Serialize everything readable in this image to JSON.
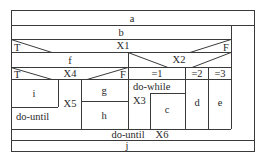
{
  "diagram": {
    "type": "nassi-shneiderman",
    "stroke_color": "#3a3a3a",
    "text_color": "#2a2a2a",
    "blocks": {
      "a": "a",
      "b": "b",
      "f": "f",
      "i": "i",
      "g": "g",
      "h": "h",
      "c": "c",
      "d": "d",
      "e": "e",
      "j": "j"
    },
    "conditions": {
      "x1": {
        "label": "X1",
        "true": "T",
        "false": "F"
      },
      "x2": {
        "label": "X2",
        "cases": [
          "=1",
          "=2",
          "=3"
        ]
      },
      "x4": {
        "label": "X4",
        "true": "T",
        "false": "F"
      }
    },
    "loops": {
      "inner_do_until": {
        "keyword": "do-until",
        "condition": "X5"
      },
      "do_while": {
        "keyword": "do-while",
        "condition": "X3"
      },
      "outer_do_until": {
        "keyword": "do-until",
        "condition": "X6"
      }
    }
  }
}
